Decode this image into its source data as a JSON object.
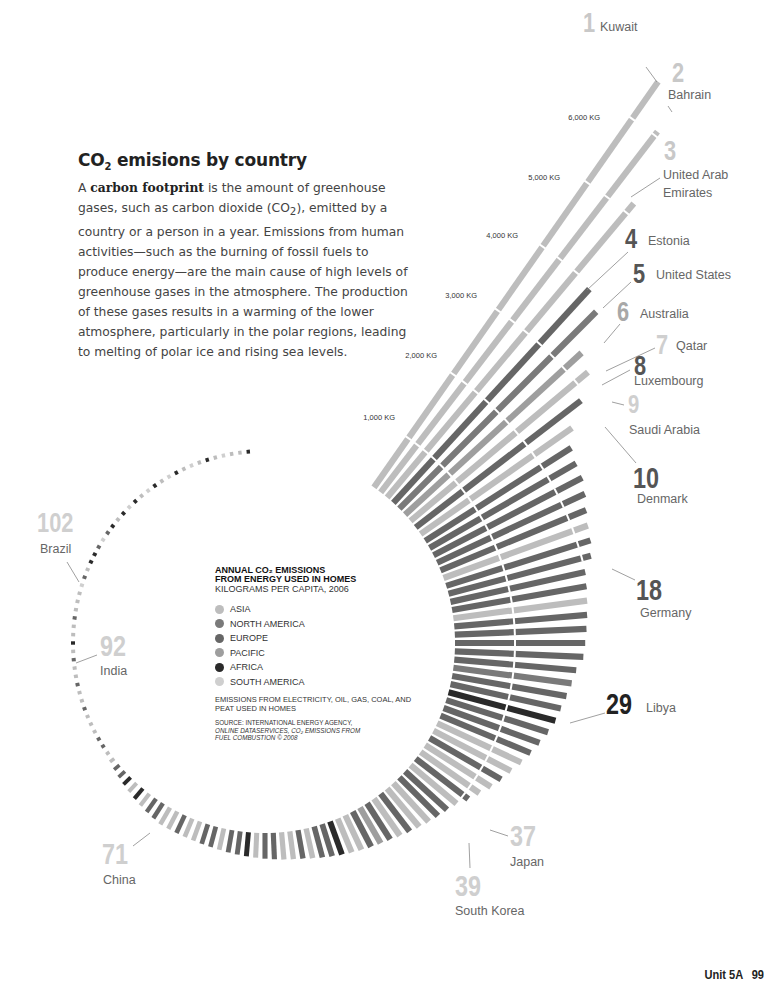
{
  "intro": {
    "title_prefix": "CO",
    "title_sub": "2",
    "title_suffix": " emisions by country",
    "p1": "A ",
    "p_bold": "carbon footprint",
    "p2": " is the amount of greenhouse gases, such as carbon dioxide (CO",
    "p_sub": "2",
    "p3": "), emitted by a country or a person in a year. Emissions from human activities—such as the burning of fossil fuels to produce energy—are the main cause of high levels of greenhouse gases in the atmosphere. The production of these gases results in a warming of the lower atmosphere, particularly in the polar regions, leading to melting of polar ice and rising sea levels."
  },
  "legend": {
    "title_line1": "ANNUAL CO₂ EMISSIONS",
    "title_line2": "FROM ENERGY USED IN HOMES",
    "subtitle": "KILOGRAMS PER CAPITA, 2006",
    "items": [
      {
        "label": "ASIA",
        "color": "#bdbdbd"
      },
      {
        "label": "NORTH AMERICA",
        "color": "#7a7a7a"
      },
      {
        "label": "EUROPE",
        "color": "#666666"
      },
      {
        "label": "PACIFIC",
        "color": "#9e9e9e"
      },
      {
        "label": "AFRICA",
        "color": "#2a2a2a"
      },
      {
        "label": "SOUTH AMERICA",
        "color": "#cfcfcf"
      }
    ],
    "note": "EMISSIONS FROM ELECTRICITY, OIL, GAS, COAL, AND PEAT USED IN HOMES",
    "source_line1": "SOURCE: INTERNATIONAL ENERGY AGENCY,",
    "source_line2": "ONLINE DATASERVICES, CO₂ EMISSIONS FROM",
    "source_line3": "FUEL COMBUSTION © 2008"
  },
  "footer": {
    "unit": "Unit 5A",
    "page": "99"
  },
  "chart_data": {
    "type": "bar",
    "subtype": "radial",
    "ylabel": "Kilograms per capita, 2006",
    "axis_ticks": [
      "1,000 KG",
      "2,000 KG",
      "3,000 KG",
      "4,000 KG",
      "5,000 KG",
      "6,000 KG"
    ],
    "axis_tick_values": [
      1000,
      2000,
      3000,
      4000,
      5000,
      6000
    ],
    "region_colors": {
      "asia": "#bdbdbd",
      "north_america": "#7a7a7a",
      "europe": "#666666",
      "pacific": "#9e9e9e",
      "africa": "#2a2a2a",
      "south_america": "#cfcfcf"
    },
    "labeled": [
      {
        "rank": 1,
        "country": "Kuwait",
        "region": "asia",
        "value": 6580
      },
      {
        "rank": 2,
        "country": "Bahrain",
        "region": "asia",
        "value": 6060
      },
      {
        "rank": 3,
        "country": "United Arab Emirates",
        "region": "asia",
        "value": 5150
      },
      {
        "rank": 4,
        "country": "Estonia",
        "region": "europe",
        "value": 3950
      },
      {
        "rank": 5,
        "country": "United States",
        "region": "north_america",
        "value": 3800
      },
      {
        "rank": 6,
        "country": "Australia",
        "region": "pacific",
        "value": 3300
      },
      {
        "rank": 7,
        "country": "Qatar",
        "region": "asia",
        "value": 3200
      },
      {
        "rank": 8,
        "country": "Luxembourg",
        "region": "europe",
        "value": 2900
      },
      {
        "rank": 9,
        "country": "Saudi Arabia",
        "region": "asia",
        "value": 2600
      },
      {
        "rank": 10,
        "country": "Denmark",
        "region": "europe",
        "value": 2450
      },
      {
        "rank": 18,
        "country": "Germany",
        "region": "europe",
        "value": 2000
      },
      {
        "rank": 29,
        "country": "Libya",
        "region": "africa",
        "value": 1650
      },
      {
        "rank": 37,
        "country": "Japan",
        "region": "asia",
        "value": 1150
      },
      {
        "rank": 39,
        "country": "South Korea",
        "region": "asia",
        "value": 1000
      },
      {
        "rank": 71,
        "country": "China",
        "region": "asia",
        "value": 480
      },
      {
        "rank": 92,
        "country": "India",
        "region": "asia",
        "value": 150
      },
      {
        "rank": 102,
        "country": "Brazil",
        "region": "south_america",
        "value": 70
      }
    ],
    "values": [
      6580,
      6060,
      5150,
      3950,
      3800,
      3300,
      3200,
      2900,
      2600,
      2450,
      2400,
      2380,
      2320,
      2250,
      2200,
      2170,
      2120,
      2000,
      1980,
      1960,
      1940,
      1920,
      1900,
      1880,
      1800,
      1760,
      1720,
      1680,
      1650,
      1600,
      1540,
      1480,
      1420,
      1350,
      1290,
      1230,
      1150,
      1080,
      1000,
      960,
      930,
      900,
      870,
      840,
      810,
      780,
      760,
      740,
      720,
      700,
      680,
      660,
      640,
      620,
      600,
      590,
      580,
      570,
      560,
      550,
      540,
      530,
      520,
      510,
      500,
      495,
      490,
      485,
      482,
      481,
      480,
      460,
      440,
      420,
      400,
      380,
      360,
      340,
      320,
      300,
      280,
      260,
      240,
      225,
      210,
      195,
      180,
      170,
      165,
      160,
      155,
      150,
      140,
      130,
      120,
      110,
      100,
      95,
      90,
      85,
      80,
      70,
      65,
      60,
      55,
      50,
      45,
      40,
      36,
      32,
      28,
      25,
      22,
      20,
      18,
      16,
      14,
      12,
      11,
      10,
      9,
      8,
      7,
      6,
      5,
      5,
      4,
      4,
      3
    ],
    "regions": [
      "asia",
      "asia",
      "asia",
      "europe",
      "north_america",
      "pacific",
      "asia",
      "europe",
      "asia",
      "europe",
      "europe",
      "europe",
      "europe",
      "europe",
      "asia",
      "europe",
      "europe",
      "europe",
      "europe",
      "asia",
      "europe",
      "europe",
      "europe",
      "europe",
      "europe",
      "north_america",
      "europe",
      "europe",
      "africa",
      "europe",
      "europe",
      "europe",
      "asia",
      "asia",
      "europe",
      "asia",
      "asia",
      "europe",
      "asia",
      "europe",
      "europe",
      "asia",
      "asia",
      "europe",
      "asia",
      "europe",
      "pacific",
      "europe",
      "asia",
      "asia",
      "africa",
      "europe",
      "europe",
      "asia",
      "europe",
      "asia",
      "asia",
      "europe",
      "europe",
      "asia",
      "africa",
      "europe",
      "europe",
      "asia",
      "europe",
      "europe",
      "asia",
      "asia",
      "europe",
      "asia",
      "asia",
      "europe",
      "europe",
      "asia",
      "africa",
      "asia",
      "africa",
      "europe",
      "europe",
      "asia",
      "asia",
      "europe",
      "europe",
      "asia",
      "asia",
      "asia",
      "europe",
      "asia",
      "asia",
      "europe",
      "asia",
      "asia",
      "europe",
      "asia",
      "africa",
      "asia",
      "asia",
      "europe",
      "asia",
      "asia",
      "asia",
      "south_america",
      "europe",
      "asia",
      "africa",
      "africa",
      "europe",
      "south_america",
      "europe",
      "africa",
      "asia",
      "africa",
      "south_america",
      "africa",
      "asia",
      "south_america",
      "africa",
      "asia",
      "south_america",
      "africa",
      "asia",
      "south_america",
      "asia",
      "africa",
      "asia",
      "south_america",
      "asia",
      "asia",
      "africa",
      "asia"
    ]
  }
}
